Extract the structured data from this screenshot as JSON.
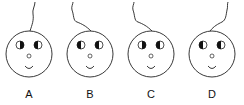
{
  "figure": {
    "colors": {
      "stroke": "#222222",
      "fill": "#ffffff",
      "pupil": "#111111"
    },
    "options": [
      {
        "label": "A",
        "center_x": 29,
        "left_eye_dark_side": "right",
        "right_eye_dark_side": "left",
        "string": "up-right"
      },
      {
        "label": "B",
        "center_x": 90,
        "left_eye_dark_side": "left",
        "right_eye_dark_side": "left",
        "string": "curl-left"
      },
      {
        "label": "C",
        "center_x": 151,
        "left_eye_dark_side": "right",
        "right_eye_dark_side": "left",
        "string": "curl-left"
      },
      {
        "label": "D",
        "center_x": 212,
        "left_eye_dark_side": "left",
        "right_eye_dark_side": "left",
        "string": "up-right"
      }
    ]
  }
}
